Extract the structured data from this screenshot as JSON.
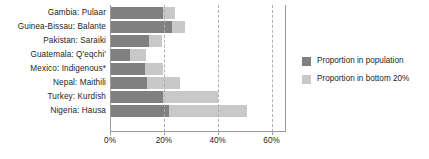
{
  "chart_data": {
    "type": "bar",
    "orientation": "horizontal",
    "title": "",
    "subtitle": "",
    "xlabel": "",
    "ylabel": "",
    "xlim": [
      0,
      65
    ],
    "grid": true,
    "gridlines_at": [
      20,
      40,
      60
    ],
    "axis_ticks": [
      {
        "value": 0,
        "label": "0%"
      },
      {
        "value": 20,
        "label": "20%"
      },
      {
        "value": 40,
        "label": "40%"
      },
      {
        "value": 60,
        "label": "60%"
      }
    ],
    "legend_position": "right",
    "categories": [
      "Gambia: Pulaar",
      "Guinea-Bissau: Balante",
      "Pakistan: Saraiki",
      "Guatemala: Q'eqchi'",
      "Mexico: Indigenous*",
      "Nepal: Maithili",
      "Turkey: Kurdish",
      "Nigeria: Hausa"
    ],
    "series": [
      {
        "name": "Proportion in population",
        "color": "#808080",
        "values": [
          19.5,
          23.0,
          14.5,
          7.5,
          13.0,
          13.7,
          19.5,
          22.0
        ]
      },
      {
        "name": "Proportion in bottom 20%",
        "color": "#c8c8c8",
        "values": [
          24.0,
          28.0,
          19.5,
          13.5,
          19.5,
          26.0,
          40.0,
          51.0
        ]
      }
    ]
  },
  "legend": {
    "items": [
      {
        "label": "Proportion in population",
        "color": "#808080"
      },
      {
        "label": "Proportion in bottom 20%",
        "color": "#c8c8c8"
      }
    ]
  }
}
